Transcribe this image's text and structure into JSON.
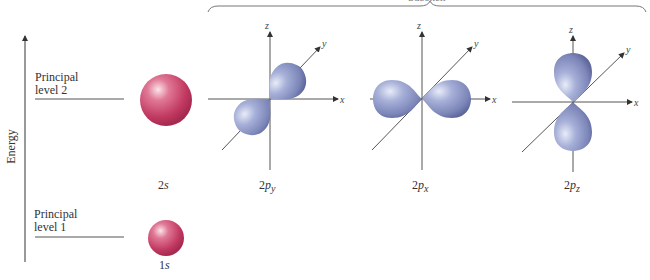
{
  "diagram": {
    "type": "atomic-orbital-energy-diagram",
    "top_brace_label": "Subshell",
    "energy_axis_label": "Energy",
    "levels": [
      {
        "label_line1": "Principal",
        "label_line2": "level 2"
      },
      {
        "label_line1": "Principal",
        "label_line2": "level 1"
      }
    ],
    "orbitals": [
      {
        "name": "2s",
        "prefix": "2",
        "letter": "s",
        "sub": "",
        "shape": "sphere",
        "color": "#c8436a"
      },
      {
        "name": "2py",
        "prefix": "2",
        "letter": "p",
        "sub": "y",
        "shape": "dumbbell-y",
        "color": "#8c96c6"
      },
      {
        "name": "2px",
        "prefix": "2",
        "letter": "p",
        "sub": "x",
        "shape": "dumbbell-x",
        "color": "#8c96c6"
      },
      {
        "name": "2pz",
        "prefix": "2",
        "letter": "p",
        "sub": "z",
        "shape": "dumbbell-z",
        "color": "#8c96c6"
      },
      {
        "name": "1s",
        "prefix": "1",
        "letter": "s",
        "sub": "",
        "shape": "sphere",
        "color": "#c8436a"
      }
    ],
    "axes": {
      "x": "x",
      "y": "y",
      "z": "z"
    }
  }
}
